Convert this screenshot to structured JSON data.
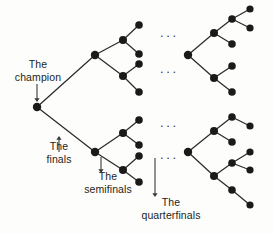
{
  "figure": {
    "type": "binary-tournament-tree-diagram",
    "background_color": "#fdfdfc",
    "node_color": "#1a1a1a",
    "edge_color": "#2b2b2b",
    "text_color": "#231f20"
  },
  "labels": {
    "champion": {
      "line1": "The",
      "line2": "champion"
    },
    "finals": {
      "line1": "The",
      "line2": "finals"
    },
    "semifinals": {
      "line1": "The",
      "line2": "semifinals"
    },
    "quarterfinals": {
      "line1": "The",
      "line2": "quarterfinals"
    }
  },
  "ellipses": {
    "glyph": "...",
    "items": [
      {
        "x": 160,
        "y": 30
      },
      {
        "x": 160,
        "y": 66
      },
      {
        "x": 160,
        "y": 120
      },
      {
        "x": 160,
        "y": 152
      }
    ]
  },
  "nodes": [
    {
      "id": "root",
      "x": 37,
      "y": 107,
      "r": 4.2,
      "role": "champion"
    },
    {
      "id": "f-top",
      "x": 95,
      "y": 55,
      "r": 4.2,
      "role": "finalist"
    },
    {
      "id": "f-bot",
      "x": 95,
      "y": 152,
      "r": 4.2,
      "role": "finalist"
    },
    {
      "id": "s-t1",
      "x": 123,
      "y": 40,
      "r": 4.0,
      "role": "semifinalist"
    },
    {
      "id": "s-t2",
      "x": 123,
      "y": 76,
      "r": 4.0,
      "role": "semifinalist"
    },
    {
      "id": "s-b1",
      "x": 123,
      "y": 133,
      "r": 4.0,
      "role": "semifinalist"
    },
    {
      "id": "s-b2",
      "x": 123,
      "y": 170,
      "r": 4.0,
      "role": "semifinalist"
    },
    {
      "id": "q-t1a",
      "x": 139,
      "y": 25,
      "r": 3.8,
      "role": "quarterfinalist"
    },
    {
      "id": "q-t1b",
      "x": 139,
      "y": 54,
      "r": 3.8,
      "role": "quarterfinalist"
    },
    {
      "id": "q-t2a",
      "x": 139,
      "y": 64,
      "r": 3.8,
      "role": "quarterfinalist"
    },
    {
      "id": "q-t2b",
      "x": 139,
      "y": 92,
      "r": 3.8,
      "role": "quarterfinalist"
    },
    {
      "id": "q-b1a",
      "x": 139,
      "y": 120,
      "r": 3.8,
      "role": "quarterfinalist"
    },
    {
      "id": "q-b1b",
      "x": 139,
      "y": 145,
      "r": 3.8,
      "role": "quarterfinalist"
    },
    {
      "id": "q-b2a",
      "x": 139,
      "y": 156,
      "r": 3.8,
      "role": "quarterfinalist"
    },
    {
      "id": "q-b2b",
      "x": 139,
      "y": 182,
      "r": 3.8,
      "role": "quarterfinalist"
    },
    {
      "id": "r-top-root",
      "x": 188,
      "y": 55,
      "r": 4.2,
      "role": "omitted-bracket-root"
    },
    {
      "id": "r-top-u",
      "x": 214,
      "y": 33,
      "r": 4.0,
      "role": "omitted-node"
    },
    {
      "id": "r-top-d",
      "x": 214,
      "y": 78,
      "r": 4.0,
      "role": "omitted-node"
    },
    {
      "id": "r-top-u1",
      "x": 232,
      "y": 19,
      "r": 3.8,
      "role": "omitted-node"
    },
    {
      "id": "r-top-u2",
      "x": 232,
      "y": 44,
      "r": 3.8,
      "role": "omitted-node"
    },
    {
      "id": "r-top-u1a",
      "x": 250,
      "y": 9,
      "r": 3.6,
      "role": "omitted-node"
    },
    {
      "id": "r-top-u1b",
      "x": 250,
      "y": 28,
      "r": 3.6,
      "role": "omitted-node"
    },
    {
      "id": "r-top-d1",
      "x": 232,
      "y": 66,
      "r": 3.8,
      "role": "omitted-node"
    },
    {
      "id": "r-top-d2",
      "x": 232,
      "y": 92,
      "r": 3.8,
      "role": "omitted-node"
    },
    {
      "id": "r-bot-root",
      "x": 188,
      "y": 152,
      "r": 4.2,
      "role": "omitted-bracket-root"
    },
    {
      "id": "r-bot-u",
      "x": 214,
      "y": 131,
      "r": 4.0,
      "role": "omitted-node"
    },
    {
      "id": "r-bot-d",
      "x": 214,
      "y": 176,
      "r": 4.0,
      "role": "omitted-node"
    },
    {
      "id": "r-bot-u1",
      "x": 232,
      "y": 117,
      "r": 3.8,
      "role": "omitted-node"
    },
    {
      "id": "r-bot-u2",
      "x": 232,
      "y": 142,
      "r": 3.8,
      "role": "omitted-node"
    },
    {
      "id": "r-bot-d1",
      "x": 232,
      "y": 163,
      "r": 3.8,
      "role": "omitted-node"
    },
    {
      "id": "r-bot-d2",
      "x": 232,
      "y": 190,
      "r": 3.8,
      "role": "omitted-node"
    },
    {
      "id": "r-bot-d1a",
      "x": 250,
      "y": 152,
      "r": 3.6,
      "role": "omitted-node"
    },
    {
      "id": "r-bot-d1b",
      "x": 250,
      "y": 170,
      "r": 3.6,
      "role": "omitted-node"
    },
    {
      "id": "r-bot-u1a",
      "x": 250,
      "y": 126,
      "r": 3.6,
      "role": "omitted-node"
    },
    {
      "id": "r-bot-d2a",
      "x": 250,
      "y": 205,
      "r": 3.6,
      "role": "omitted-node"
    }
  ],
  "edges": [
    [
      "root",
      "f-top"
    ],
    [
      "root",
      "f-bot"
    ],
    [
      "f-top",
      "s-t1"
    ],
    [
      "f-top",
      "s-t2"
    ],
    [
      "f-bot",
      "s-b1"
    ],
    [
      "f-bot",
      "s-b2"
    ],
    [
      "s-t1",
      "q-t1a"
    ],
    [
      "s-t1",
      "q-t1b"
    ],
    [
      "s-t2",
      "q-t2a"
    ],
    [
      "s-t2",
      "q-t2b"
    ],
    [
      "s-b1",
      "q-b1a"
    ],
    [
      "s-b1",
      "q-b1b"
    ],
    [
      "s-b2",
      "q-b2a"
    ],
    [
      "s-b2",
      "q-b2b"
    ],
    [
      "r-top-root",
      "r-top-u"
    ],
    [
      "r-top-root",
      "r-top-d"
    ],
    [
      "r-top-u",
      "r-top-u1"
    ],
    [
      "r-top-u",
      "r-top-u2"
    ],
    [
      "r-top-u1",
      "r-top-u1a"
    ],
    [
      "r-top-u1",
      "r-top-u1b"
    ],
    [
      "r-top-d",
      "r-top-d1"
    ],
    [
      "r-top-d",
      "r-top-d2"
    ],
    [
      "r-bot-root",
      "r-bot-u"
    ],
    [
      "r-bot-root",
      "r-bot-d"
    ],
    [
      "r-bot-u",
      "r-bot-u1"
    ],
    [
      "r-bot-u",
      "r-bot-u2"
    ],
    [
      "r-bot-d",
      "r-bot-d1"
    ],
    [
      "r-bot-d",
      "r-bot-d2"
    ],
    [
      "r-bot-d1",
      "r-bot-d1a"
    ],
    [
      "r-bot-d1",
      "r-bot-d1b"
    ],
    [
      "r-bot-u1",
      "r-bot-u1a"
    ],
    [
      "r-bot-d2",
      "r-bot-d2a"
    ]
  ],
  "arrows": [
    {
      "id": "champion-arrow",
      "x1": 37,
      "y1": 84,
      "x2": 37,
      "y2": 101,
      "direction": "down"
    },
    {
      "id": "finals-arrow",
      "x1": 59,
      "y1": 152,
      "x2": 59,
      "y2": 137,
      "direction": "up"
    },
    {
      "id": "semifinals-arrow",
      "x1": 101,
      "y1": 157,
      "x2": 101,
      "y2": 172,
      "direction": "down"
    },
    {
      "id": "quarterfinals-arrow",
      "x1": 155,
      "y1": 158,
      "x2": 155,
      "y2": 196,
      "direction": "down"
    }
  ]
}
